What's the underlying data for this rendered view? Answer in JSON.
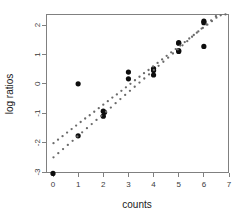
{
  "chart_data": {
    "type": "scatter",
    "title": "",
    "xlabel": "counts",
    "ylabel": "log ratios",
    "xlim": [
      -0.3,
      7.3
    ],
    "ylim": [
      -3.4,
      2.45
    ],
    "xticks": [
      0,
      1,
      2,
      3,
      4,
      5,
      6,
      7
    ],
    "xticklabels": [
      "0",
      "1",
      "2",
      "3",
      "4",
      "5",
      "6",
      "7"
    ],
    "yticks": [
      2,
      1,
      0,
      -1,
      -2,
      -3
    ],
    "yticklabels": [
      "2",
      "1",
      "0",
      "-1",
      "-2",
      "-3"
    ],
    "grid": false,
    "legend": null,
    "box": "full",
    "series": [
      {
        "name": "observed",
        "marker": "filled-circle",
        "size": "large",
        "color": "#0d0d0d",
        "points": [
          [
            0.0,
            -3.05
          ],
          [
            1.0,
            0.0
          ],
          [
            1.0,
            -1.77
          ],
          [
            2.0,
            -0.93
          ],
          [
            2.0,
            -1.1
          ],
          [
            2.05,
            -0.97
          ],
          [
            3.0,
            0.4
          ],
          [
            3.0,
            0.17
          ],
          [
            4.0,
            0.52
          ],
          [
            4.0,
            0.45
          ],
          [
            4.0,
            0.3
          ],
          [
            5.0,
            1.4
          ],
          [
            5.0,
            1.38
          ],
          [
            5.0,
            1.13
          ],
          [
            5.0,
            1.1
          ],
          [
            6.0,
            2.13
          ],
          [
            6.0,
            2.08
          ],
          [
            6.0,
            1.27
          ]
        ]
      },
      {
        "name": "fitted-upper",
        "marker": "dotted-line",
        "size": "small",
        "color": "#6b6b6b",
        "points": [
          [
            0.02,
            -2.02
          ],
          [
            0.2,
            -1.9
          ],
          [
            0.38,
            -1.78
          ],
          [
            0.56,
            -1.66
          ],
          [
            0.74,
            -1.54
          ],
          [
            0.92,
            -1.42
          ],
          [
            1.1,
            -1.3
          ],
          [
            1.28,
            -1.18
          ],
          [
            1.46,
            -1.07
          ],
          [
            1.64,
            -0.95
          ],
          [
            1.82,
            -0.83
          ],
          [
            2.0,
            -0.71
          ],
          [
            2.18,
            -0.59
          ],
          [
            2.36,
            -0.47
          ],
          [
            2.54,
            -0.36
          ],
          [
            2.72,
            -0.24
          ],
          [
            2.9,
            -0.12
          ],
          [
            3.08,
            0.0
          ],
          [
            3.26,
            0.12
          ],
          [
            3.44,
            0.24
          ],
          [
            3.62,
            0.36
          ],
          [
            3.8,
            0.47
          ],
          [
            3.98,
            0.59
          ],
          [
            4.16,
            0.71
          ],
          [
            4.34,
            0.83
          ],
          [
            4.52,
            0.95
          ],
          [
            4.7,
            1.07
          ],
          [
            4.88,
            1.18
          ],
          [
            5.06,
            1.3
          ],
          [
            5.24,
            1.42
          ],
          [
            5.42,
            1.54
          ],
          [
            5.6,
            1.66
          ],
          [
            5.78,
            1.78
          ],
          [
            5.96,
            1.9
          ],
          [
            6.14,
            2.01
          ],
          [
            6.32,
            2.13
          ],
          [
            6.5,
            2.25
          ]
        ]
      },
      {
        "name": "fitted-lower",
        "marker": "dotted-line",
        "size": "small",
        "color": "#6b6b6b",
        "points": [
          [
            0.02,
            -2.5
          ],
          [
            0.21,
            -2.36
          ],
          [
            0.4,
            -2.22
          ],
          [
            0.59,
            -2.08
          ],
          [
            0.78,
            -1.94
          ],
          [
            0.97,
            -1.79
          ],
          [
            1.16,
            -1.65
          ],
          [
            1.35,
            -1.51
          ],
          [
            1.54,
            -1.37
          ],
          [
            1.73,
            -1.23
          ],
          [
            1.92,
            -1.09
          ],
          [
            2.11,
            -0.95
          ],
          [
            2.3,
            -0.81
          ],
          [
            2.49,
            -0.66
          ],
          [
            2.68,
            -0.52
          ],
          [
            2.87,
            -0.38
          ],
          [
            3.06,
            -0.24
          ],
          [
            3.25,
            -0.1
          ],
          [
            3.44,
            0.04
          ],
          [
            3.63,
            0.18
          ],
          [
            3.82,
            0.32
          ],
          [
            4.01,
            0.47
          ],
          [
            4.2,
            0.61
          ],
          [
            4.39,
            0.75
          ],
          [
            4.58,
            0.89
          ],
          [
            4.77,
            1.03
          ],
          [
            4.96,
            1.17
          ],
          [
            5.15,
            1.31
          ],
          [
            5.34,
            1.45
          ],
          [
            5.53,
            1.6
          ],
          [
            5.72,
            1.74
          ],
          [
            5.91,
            1.88
          ],
          [
            6.1,
            2.02
          ],
          [
            6.29,
            2.16
          ],
          [
            6.48,
            2.3
          ],
          [
            6.67,
            2.33
          ],
          [
            6.86,
            2.36
          ]
        ]
      }
    ]
  },
  "colors": {
    "background": "#ffffff",
    "axis": "#808080",
    "observed_point": "#0d0d0d",
    "fitted_point": "#6b6b6b",
    "tick_label": "#3a3a3a",
    "axis_title": "#1a1a1a"
  }
}
